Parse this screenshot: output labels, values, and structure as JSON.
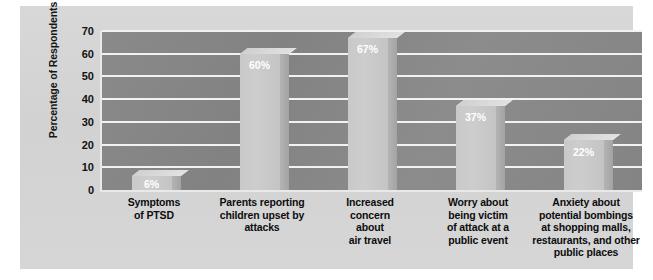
{
  "chart_data": {
    "type": "bar",
    "title": "",
    "subtitle": "",
    "xlabel": "",
    "ylabel": "Percentage of Respondents",
    "ylim": [
      0,
      70
    ],
    "ytick_step": 10,
    "yticks": [
      70,
      60,
      50,
      40,
      30,
      20,
      10,
      0
    ],
    "grid": true,
    "legend": "none",
    "value_label_suffix": "%",
    "categories": [
      "Symptoms of PTSD",
      "Parents reporting children upset by attacks",
      "Increased concern about air travel",
      "Worry about being victim of attack at a public event",
      "Anxiety about potential bombings at shopping malls, restaurants, and other public places"
    ],
    "category_lines": [
      [
        "Symptoms",
        "of PTSD"
      ],
      [
        "Parents reporting",
        "children upset by",
        "attacks"
      ],
      [
        "Increased",
        "concern",
        "about",
        "air travel"
      ],
      [
        "Worry about",
        "being victim",
        "of attack at a",
        "public event"
      ],
      [
        "Anxiety about",
        "potential bombings",
        "at shopping malls,",
        "restaurants, and other",
        "public places"
      ]
    ],
    "values": [
      6,
      60,
      67,
      37,
      22
    ],
    "value_labels": [
      "6%",
      "60%",
      "67%",
      "37%",
      "22%"
    ]
  },
  "style": {
    "plot_background": "#878787",
    "figure_background": "#d4d4d4",
    "gridline_color": "#f2f2f2",
    "bar_color": "#c8c8c8",
    "bar_side_color": "#ababab",
    "bar_top_color": "#dcdcdc",
    "value_label_color": "#ffffff",
    "axis_text_color": "#111111"
  }
}
